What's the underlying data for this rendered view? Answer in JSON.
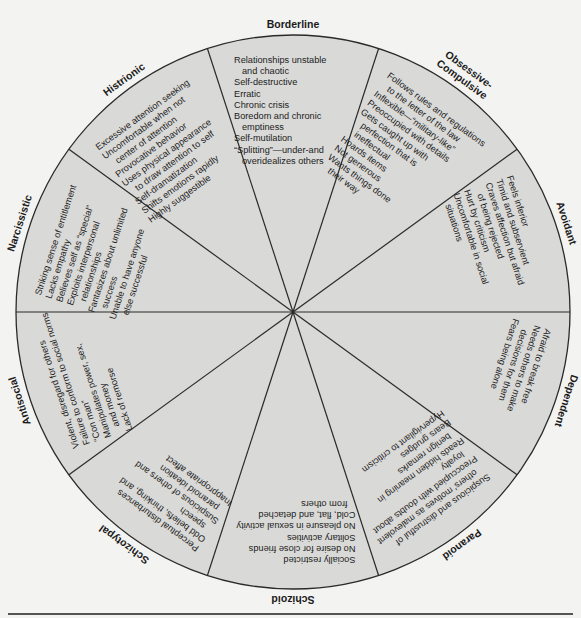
{
  "diagram": {
    "type": "wheel",
    "colors": {
      "page_background": "#f3f3f2",
      "wheel_fill": "#d9d9d7",
      "line": "#2a2a2a"
    },
    "segments": [
      {
        "label": "Borderline",
        "traits": [
          "Relationships unstable",
          "   and chaotic",
          "Self-destructive",
          "Erratic",
          "Chronic crisis",
          "Boredom and chronic",
          "   emptiness",
          "Self-mutilation",
          "“Splitting”—under-and",
          "   overidealizes others"
        ]
      },
      {
        "label": "Obsessive-Compulsive",
        "label_lines": [
          "Obsessive-",
          "Compulsive"
        ],
        "traits": [
          "Follows rules and regulations",
          "   to the letter of the law",
          "Inflexible—“military-like”",
          "Preoccupied with details",
          "Gets caught up with",
          "   perfection that is",
          "   ineffectual",
          "Hoards items",
          "Not generous",
          "Wants things done",
          "   their way"
        ]
      },
      {
        "label": "Avoidant",
        "traits": [
          "Feels inferior",
          "Timid and subservient",
          "Craves affection but afraid",
          "   of being rejected",
          "Hurt by criticism",
          "Uncomfortable in social",
          "   situations"
        ]
      },
      {
        "label": "Dependent",
        "traits": [
          "Afraid to break free",
          "Needs others to make",
          "   decisions for them",
          "Fears being alone"
        ]
      },
      {
        "label": "Paranoid",
        "traits": [
          "Suspicious and distrustful of",
          "   others' motives as malevolent",
          "Preoccupied with doubts about",
          "   loyalty",
          "Reads hidden meaning in",
          "   benign remarks",
          "Bears grudges",
          "Hypervigilant to criticism"
        ]
      },
      {
        "label": "Schizoid",
        "traits": [
          "Socially restricted",
          "No desire for close friends",
          "Solitary activities",
          "No pleasure in sexual activity",
          "Cold, flat, and detached",
          "   from others"
        ]
      },
      {
        "label": "Schizotypal",
        "traits": [
          "Perceptual disturbances",
          "Odd beliefs, thinking, and",
          "   speech",
          "Suspicious of others and",
          "   paranoid ideation",
          "Inappropriate affect"
        ]
      },
      {
        "label": "Antisocial",
        "traits": [
          "Violent, disregard for others",
          "Failure to conform to social norms",
          "“Con man”",
          "Manipulates power, sex,",
          "   and money",
          "Lack of remorse"
        ]
      },
      {
        "label": "Narcissistic",
        "traits": [
          "Striking sense of entitlement",
          "Lacks empathy",
          "Believes self as “special”",
          "Exploits interpersonal",
          "   relationships",
          "Fantasizes about unlimited",
          "   success",
          "Unable to have anyone",
          "   else successful"
        ]
      },
      {
        "label": "Histrionic",
        "traits": [
          "Excessive attention seeking",
          "Uncomfortable when not",
          "   center of attention",
          "Provocative behavior",
          "Uses physical appearance",
          "   to draw attention to self",
          "Self-dramatization",
          "Shifts emotions rapidly",
          "Highly suggestible"
        ]
      }
    ]
  }
}
